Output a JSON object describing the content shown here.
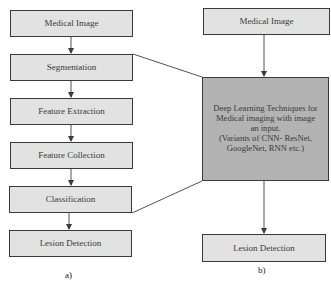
{
  "diagram": {
    "panel_a": {
      "caption": "a)",
      "steps": [
        {
          "label": "Medical Image"
        },
        {
          "label": "Segmentation"
        },
        {
          "label": "Feature Extraction"
        },
        {
          "label": "Feature Collection"
        },
        {
          "label": "Classification"
        },
        {
          "label": "Lesion Detection"
        }
      ]
    },
    "panel_b": {
      "caption": "b)",
      "input": {
        "label": "Medical Image"
      },
      "dl_block": {
        "line1": "Deep Learning Techniques for",
        "line2": "Medical imaging with image",
        "line3": "an input.",
        "line4": "(Variants of CNN- ResNet,",
        "line5": "GoogleNet, RNN etc.)"
      },
      "output": {
        "label": "Lesion Detection"
      }
    },
    "colors": {
      "box_fill": "#e2e2e2",
      "dl_box_fill": "#b3b3b3",
      "stroke": "#3a3a3a"
    }
  }
}
